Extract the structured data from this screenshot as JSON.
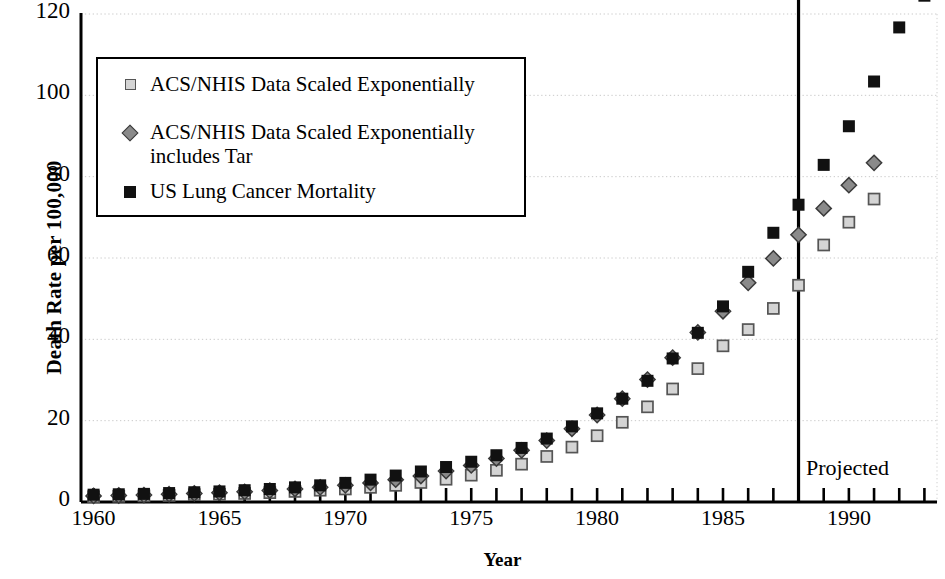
{
  "chart_data": {
    "type": "scatter",
    "title": "",
    "xlabel": "Year",
    "ylabel": "Death Rate per 100,000",
    "xlim": [
      1959.5,
      1993.5
    ],
    "ylim": [
      0,
      120
    ],
    "yticks": [
      0,
      20,
      40,
      60,
      80,
      100,
      120
    ],
    "xticks": [
      1960,
      1965,
      1970,
      1975,
      1980,
      1985,
      1990
    ],
    "xtick_labels": [
      "1960",
      "1965",
      "1970",
      "1975",
      "1980",
      "1985",
      "1990"
    ],
    "grid": true,
    "grid_axis": "y",
    "legend_position": "upper-left",
    "x": [
      1960,
      1961,
      1962,
      1963,
      1964,
      1965,
      1966,
      1967,
      1968,
      1969,
      1970,
      1971,
      1972,
      1973,
      1974,
      1975,
      1976,
      1977,
      1978,
      1979,
      1980,
      1981,
      1982,
      1983,
      1984,
      1985,
      1986,
      1987,
      1988,
      1989,
      1990,
      1991,
      1992,
      1993
    ],
    "series": [
      {
        "name": "ACS/NHIS Data Scaled Exponentially",
        "marker": "open-square",
        "color": "#d4d4d4",
        "edge_color": "#555555",
        "values": [
          1.3,
          1.4,
          1.5,
          1.6,
          1.8,
          1.9,
          2.1,
          2.3,
          2.6,
          2.9,
          3.2,
          3.6,
          4.1,
          4.8,
          5.6,
          6.6,
          7.8,
          9.3,
          11.2,
          13.5,
          16.3,
          19.6,
          23.4,
          27.8,
          32.8,
          38.4,
          42.4,
          47.6,
          53.3,
          63.2,
          68.8,
          74.5,
          null,
          null
        ]
      },
      {
        "name": "ACS/NHIS Data Scaled Exponentially\nincludes Tar",
        "marker": "diamond",
        "color": "#8a8a8a",
        "edge_color": "#3a3a3a",
        "values": [
          1.5,
          1.6,
          1.7,
          1.9,
          2.1,
          2.3,
          2.5,
          2.8,
          3.2,
          3.6,
          4.1,
          4.7,
          5.5,
          6.4,
          7.6,
          9.0,
          10.7,
          12.7,
          15.1,
          18.0,
          21.4,
          25.4,
          30.1,
          35.5,
          41.7,
          46.9,
          53.9,
          59.9,
          65.7,
          72.2,
          77.9,
          83.4,
          null,
          null
        ]
      },
      {
        "name": "US Lung Cancer Mortality",
        "marker": "filled-square",
        "color": "#111111",
        "edge_color": "#111111",
        "values": [
          1.8,
          1.9,
          2.0,
          2.2,
          2.4,
          2.6,
          2.9,
          3.2,
          3.6,
          4.1,
          4.7,
          5.5,
          6.5,
          7.5,
          8.6,
          9.9,
          11.5,
          13.3,
          15.6,
          18.6,
          21.8,
          25.4,
          29.8,
          35.3,
          41.6,
          48.1,
          56.6,
          66.2,
          73.1,
          82.9,
          92.4,
          103.4,
          116.7,
          124.5
        ]
      }
    ],
    "annotations": [
      {
        "text": "Projected",
        "x": 1989.2,
        "y": 11.5,
        "type": "label"
      },
      {
        "text": "",
        "x": 1988,
        "type": "vline"
      }
    ],
    "vline_year": 1988,
    "projected_label": "Projected"
  },
  "axes": {
    "y_title": "Death Rate per 100,000",
    "x_title": "Year"
  },
  "legend": {
    "entries": [
      {
        "label": "ACS/NHIS Data Scaled Exponentially",
        "marker": "open-square-marker"
      },
      {
        "label": "ACS/NHIS Data Scaled Exponentially\nincludes Tar",
        "marker": "diamond-marker"
      },
      {
        "label": "US Lung Cancer Mortality",
        "marker": "filled-square-marker"
      }
    ]
  }
}
